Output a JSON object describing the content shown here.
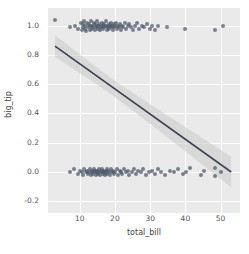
{
  "chart_data": {
    "type": "scatter",
    "title": "",
    "xlabel": "total_bill",
    "ylabel": "big_tip",
    "xlim": [
      1.0,
      55.5
    ],
    "ylim": [
      -0.28,
      1.12
    ],
    "xticks": [
      10,
      20,
      30,
      40,
      50
    ],
    "xticklabels": [
      "10",
      "20",
      "30",
      "40",
      "50"
    ],
    "yticks": [
      -0.2,
      0.0,
      0.2,
      0.4,
      0.6,
      0.8,
      1.0
    ],
    "yticklabels": [
      "-0.2",
      "0.0",
      "0.2",
      "0.4",
      "0.6",
      "0.8",
      "1.0"
    ],
    "grid": true,
    "legend": "none",
    "background_color": "#eaeaea",
    "grid_color": "#ffffff",
    "point_color": "#4c566a",
    "line_color": "#3b4252",
    "band_color": "#c9c9c9",
    "regression": {
      "type": "linear",
      "x_start": 3.0,
      "y_start": 0.86,
      "x_end": 53.0,
      "y_end": 0.0,
      "slope": -0.0172,
      "intercept": 0.912,
      "ci_band": true,
      "ci_halfwidth_start": 0.055,
      "ci_halfwidth_end": 0.105
    },
    "series": [
      {
        "name": "big_tip = 1",
        "jittered": true,
        "x": [
          3.1,
          7.2,
          8.6,
          9.6,
          10.3,
          10.6,
          10.8,
          11.0,
          11.2,
          11.4,
          11.6,
          11.9,
          12.1,
          12.4,
          12.6,
          12.8,
          13.0,
          13.2,
          13.4,
          13.6,
          13.8,
          14.0,
          14.2,
          14.4,
          14.6,
          14.8,
          15.0,
          15.2,
          15.4,
          15.6,
          15.8,
          16.0,
          16.2,
          16.4,
          16.6,
          16.8,
          17.0,
          17.2,
          17.4,
          17.6,
          17.8,
          18.0,
          18.2,
          18.4,
          18.6,
          18.8,
          19.0,
          19.2,
          19.4,
          19.6,
          19.8,
          20.0,
          20.3,
          20.6,
          20.9,
          21.2,
          21.5,
          21.8,
          22.1,
          22.4,
          22.8,
          23.2,
          23.6,
          24.0,
          24.5,
          25.0,
          25.6,
          26.2,
          26.9,
          27.6,
          28.3,
          29.0,
          29.8,
          30.6,
          31.4,
          32.2,
          34.8,
          39.9,
          48.5,
          50.8
        ],
        "y": [
          1.04,
          0.99,
          1.0,
          0.98,
          1.02,
          0.97,
          1.01,
          0.99,
          1.03,
          0.98,
          1.0,
          0.96,
          1.02,
          0.99,
          1.01,
          0.97,
          1.0,
          1.03,
          0.98,
          1.0,
          0.99,
          1.02,
          0.97,
          1.01,
          0.99,
          1.0,
          1.03,
          0.98,
          1.0,
          1.01,
          0.97,
          0.99,
          1.02,
          1.0,
          0.98,
          1.01,
          0.99,
          1.0,
          1.03,
          0.97,
          1.0,
          0.99,
          1.01,
          0.98,
          1.0,
          1.02,
          0.99,
          1.0,
          0.97,
          1.01,
          0.99,
          1.0,
          1.02,
          0.98,
          1.0,
          0.99,
          1.01,
          0.97,
          1.0,
          0.99,
          1.02,
          0.98,
          1.0,
          1.01,
          0.99,
          0.97,
          1.0,
          1.02,
          0.98,
          1.0,
          0.99,
          1.01,
          0.98,
          1.0,
          0.97,
          1.0,
          0.99,
          0.98,
          0.97,
          1.0
        ]
      },
      {
        "name": "big_tip = 0",
        "jittered": true,
        "x": [
          7.3,
          8.4,
          9.6,
          10.1,
          10.6,
          11.0,
          11.3,
          11.7,
          12.0,
          12.3,
          12.6,
          12.9,
          13.2,
          13.4,
          13.6,
          13.8,
          14.0,
          14.2,
          14.4,
          14.6,
          14.8,
          15.0,
          15.2,
          15.4,
          15.6,
          15.8,
          16.0,
          16.2,
          16.4,
          16.6,
          16.8,
          17.0,
          17.2,
          17.4,
          17.6,
          17.8,
          18.0,
          18.3,
          18.6,
          18.9,
          19.2,
          19.5,
          19.8,
          20.1,
          20.5,
          20.9,
          21.3,
          21.7,
          22.1,
          22.6,
          23.1,
          23.6,
          24.1,
          24.7,
          25.3,
          25.9,
          26.6,
          27.3,
          28.0,
          28.8,
          29.6,
          30.4,
          31.3,
          32.2,
          33.2,
          34.3,
          35.5,
          36.7,
          38.0,
          39.4,
          40.2,
          41.2,
          44.3,
          45.4,
          48.3,
          48.3,
          50.2
        ],
        "y": [
          0.0,
          0.02,
          -0.01,
          0.01,
          0.0,
          -0.02,
          0.02,
          0.0,
          0.01,
          -0.01,
          0.0,
          0.02,
          -0.02,
          0.01,
          0.0,
          -0.01,
          0.02,
          0.0,
          0.01,
          -0.02,
          0.0,
          0.01,
          -0.01,
          0.02,
          0.0,
          -0.02,
          0.01,
          0.0,
          0.02,
          -0.01,
          0.0,
          0.01,
          -0.02,
          0.0,
          0.02,
          -0.01,
          0.01,
          0.0,
          -0.02,
          0.02,
          0.0,
          0.01,
          -0.01,
          0.0,
          0.02,
          -0.02,
          0.01,
          0.0,
          -0.01,
          0.02,
          0.0,
          0.01,
          -0.02,
          0.0,
          0.02,
          -0.01,
          0.01,
          0.0,
          0.02,
          -0.02,
          0.0,
          0.01,
          -0.01,
          0.02,
          0.0,
          -0.02,
          0.01,
          0.0,
          0.02,
          -0.01,
          0.0,
          0.03,
          -0.02,
          0.01,
          0.03,
          -0.03,
          0.0
        ]
      }
    ]
  }
}
